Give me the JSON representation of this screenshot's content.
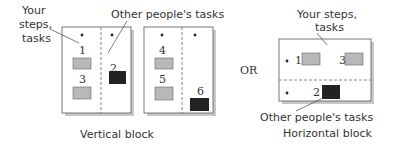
{
  "colors": {
    "your_task": "#b8b8b8",
    "other_task": "#222222",
    "panel_border": "#555555",
    "shadow": "#c8c8c8",
    "text": "#333333"
  },
  "labels": {
    "your_steps_left_line1": "Your",
    "your_steps_left_line2": "steps,",
    "your_steps_left_line3": "tasks",
    "other_people_top": "Other people's tasks",
    "or": "OR",
    "your_steps_right_line1": "Your steps,",
    "your_steps_right_line2": "tasks",
    "other_people_bottom": "Other people's tasks",
    "vertical_caption": "Vertical block",
    "horizontal_caption": "Horizontal block"
  },
  "vertical_block": {
    "panels": [
      {
        "tasks": [
          {
            "n": "1",
            "type": "yours"
          },
          {
            "n": "2",
            "type": "other"
          },
          {
            "n": "3",
            "type": "yours"
          }
        ]
      },
      {
        "tasks": [
          {
            "n": "4",
            "type": "yours"
          },
          {
            "n": "5",
            "type": "yours"
          },
          {
            "n": "6",
            "type": "other"
          }
        ]
      }
    ]
  },
  "horizontal_block": {
    "tasks": [
      {
        "n": "1",
        "type": "yours"
      },
      {
        "n": "3",
        "type": "yours"
      },
      {
        "n": "2",
        "type": "other"
      }
    ]
  }
}
